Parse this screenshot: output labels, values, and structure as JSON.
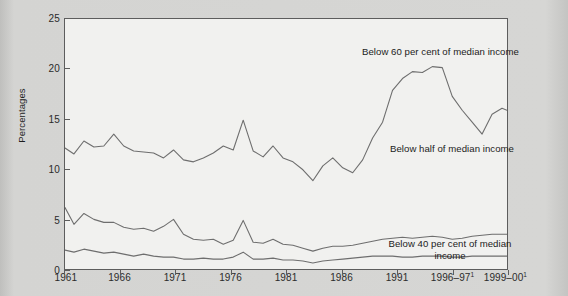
{
  "chart_data": {
    "type": "line",
    "title": "",
    "xlabel": "",
    "ylabel": "Percentages",
    "ylim": [
      0,
      25
    ],
    "yticks": [
      0,
      5,
      10,
      15,
      20,
      25
    ],
    "ytick_labels": [
      "0",
      "5",
      "10",
      "15",
      "20",
      "25"
    ],
    "grid": false,
    "legend_position": "inline-annotations",
    "x": [
      1961,
      1962,
      1963,
      1964,
      1965,
      1966,
      1967,
      1968,
      1969,
      1970,
      1971,
      1972,
      1973,
      1974,
      1975,
      1976,
      1977,
      1978,
      1979,
      1980,
      1981,
      1982,
      1983,
      1984,
      1985,
      1986,
      1987,
      1988,
      1989,
      1990,
      1991,
      1992,
      1993,
      1994,
      1995,
      1996,
      1997,
      1998,
      1999
    ],
    "xtick_positions": [
      1961,
      1966,
      1971,
      1976,
      1981,
      1986,
      1991,
      1996,
      1999
    ],
    "xtick_labels": [
      "1961",
      "1966",
      "1971",
      "1976",
      "1981",
      "1986",
      "1991",
      "1996–97",
      "1999–00"
    ],
    "xtick_footnotes": [
      "",
      "",
      "",
      "",
      "",
      "",
      "",
      "1",
      "1"
    ],
    "series": [
      {
        "name": "Below 60 per cent of median income",
        "annotation": "Below 60 per cent of median income",
        "values": [
          12.6,
          12.0,
          13.1,
          12.6,
          12.7,
          13.4,
          12.5,
          12.2,
          12.2,
          12.1,
          11.6,
          12.3,
          11.5,
          11.3,
          11.6,
          12.0,
          12.6,
          12.3,
          15.1,
          12.7,
          12.1,
          12.9,
          12.0,
          11.6,
          11.1,
          10.0,
          11.7,
          12.2,
          11.4,
          10.9,
          11.7,
          13.8,
          13.5,
          12.4,
          12.2,
          12.1,
          12.3,
          12.9,
          13.0
        ]
      },
      {
        "name": "Below half of median income",
        "annotation": "Below half of median income",
        "values": [
          7.2,
          5.7,
          6.8,
          6.2,
          5.9,
          5.9,
          5.5,
          5.3,
          5.4,
          5.1,
          5.6,
          6.2,
          5.0,
          4.7,
          4.6,
          4.7,
          4.3,
          4.6,
          6.0,
          4.5,
          4.4,
          4.7,
          4.3,
          4.2,
          4.0,
          3.8,
          4.1,
          4.2,
          4.2,
          4.3,
          4.5,
          4.6,
          4.7,
          4.7,
          4.6,
          4.6,
          4.7,
          4.8,
          4.8
        ]
      },
      {
        "name": "Below 40 per cent of median income",
        "annotation": "Below 40 per cent of median income",
        "values": [
          3.1,
          2.9,
          3.2,
          3.0,
          2.8,
          2.9,
          2.7,
          2.5,
          2.7,
          2.5,
          2.4,
          2.4,
          2.2,
          2.2,
          2.3,
          2.2,
          2.2,
          2.4,
          2.9,
          2.2,
          2.2,
          2.3,
          2.1,
          2.1,
          2.0,
          1.8,
          2.0,
          2.1,
          2.2,
          2.3,
          2.4,
          2.5,
          2.5,
          2.5,
          2.4,
          2.4,
          2.5,
          2.5,
          2.5
        ]
      }
    ],
    "series_pixel_paths": {
      "below60": "0,130 9,136 19,123 29,129 39,128 49,116 59,128 69,133 79,134 89,135 99,140 109,132 119,142 129,144 139,140 149,135 159,128 169,132 179,102 189,133 199,139 209,128 219,140 229,144 239,152 249,163 259,148 269,140 279,150 289,155 299,142 309,120 319,104 329,72 339,60 349,53 359,54 369,48 379,49 389,78 399,92 409,104 419,116 429,96 439,90 444,92",
      "belowhalf": "0,190 9,207 19,196 29,202 39,205 49,205 59,210 69,212 79,211 89,214 99,209 109,202 119,217 129,222 139,223 149,222 159,227 169,223 179,203 189,225 199,226 209,222 219,227 229,228 239,231 249,234 259,231 269,229 279,229 289,228 299,226 309,224 319,222 329,221 339,220 349,221 359,220 369,219 379,220 389,222 399,221 409,219 419,218 429,217 439,217 444,217",
      "below40": "0,233 9,235 19,232 29,234 39,236 49,235 59,237 69,239 79,237 89,239 99,240 109,240 119,242 129,242 139,241 149,242 159,242 169,240 179,235 189,242 199,242 209,241 219,243 229,243 239,244 249,246 259,244 269,243 279,242 289,241 299,240 309,239 319,239 329,239 339,240 349,240 359,239 369,239 379,239 389,240 399,240 409,239 419,239 429,239 439,239 444,239"
    },
    "colors": {
      "page_background": "#d2d2d0",
      "plot_background": "#f1f1ef",
      "frame": "#5d5d5d",
      "line": "#6e6e6e",
      "text": "#1d1d1d"
    }
  },
  "axes": {
    "y_title": "Percentages",
    "y_ticks": [
      {
        "label": "25",
        "value": 25
      },
      {
        "label": "20",
        "value": 20
      },
      {
        "label": "15",
        "value": 15
      },
      {
        "label": "10",
        "value": 10
      },
      {
        "label": "5",
        "value": 5
      },
      {
        "label": "0",
        "value": 0
      }
    ],
    "x_ticks": [
      {
        "label": "1961",
        "footnote": ""
      },
      {
        "label": "1966",
        "footnote": ""
      },
      {
        "label": "1971",
        "footnote": ""
      },
      {
        "label": "1976",
        "footnote": ""
      },
      {
        "label": "1981",
        "footnote": ""
      },
      {
        "label": "1986",
        "footnote": ""
      },
      {
        "label": "1991",
        "footnote": ""
      },
      {
        "label": "1996–97",
        "footnote": "1"
      },
      {
        "label": "1999–00",
        "footnote": "1"
      }
    ]
  },
  "annotations": {
    "below60": "Below 60 per cent of median income",
    "below_half": "Below half of median income",
    "below40": "Below 40 per cent of median income"
  }
}
